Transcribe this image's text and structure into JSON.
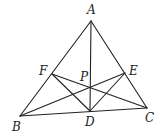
{
  "diagram": {
    "type": "triangle-cevians",
    "points": {
      "A": {
        "label": "A",
        "x": 91,
        "y": 21,
        "lx": 87,
        "ly": 14
      },
      "B": {
        "label": "B",
        "x": 20,
        "y": 116,
        "lx": 12,
        "ly": 131
      },
      "C": {
        "label": "C",
        "x": 147,
        "y": 108,
        "lx": 145,
        "ly": 122
      },
      "D": {
        "label": "D",
        "x": 90,
        "y": 111,
        "lx": 85,
        "ly": 126
      },
      "E": {
        "label": "E",
        "x": 125,
        "y": 73,
        "lx": 129,
        "ly": 75
      },
      "F": {
        "label": "F",
        "x": 52,
        "y": 74,
        "lx": 39,
        "ly": 75
      },
      "P": {
        "label": "P",
        "x": 90,
        "y": 87,
        "lx": 80,
        "ly": 81
      }
    },
    "segments": [
      [
        "A",
        "B"
      ],
      [
        "A",
        "C"
      ],
      [
        "B",
        "C"
      ],
      [
        "A",
        "D"
      ],
      [
        "B",
        "E"
      ],
      [
        "C",
        "F"
      ],
      [
        "D",
        "E"
      ],
      [
        "D",
        "F"
      ]
    ]
  }
}
